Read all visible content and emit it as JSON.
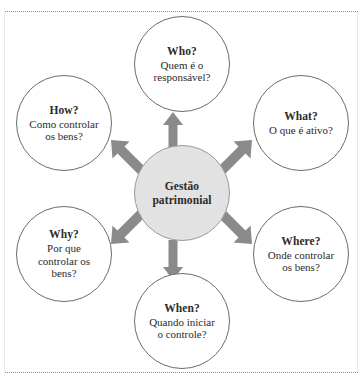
{
  "diagram": {
    "center": {
      "title_line1": "Gestão",
      "title_line2": "patrimonial"
    },
    "nodes": [
      {
        "id": "who",
        "question": "Who?",
        "answer_line1": "Quem é o",
        "answer_line2": "responsável?",
        "answer_line3": "",
        "position": "top"
      },
      {
        "id": "what",
        "question": "What?",
        "answer_line1": "O que é ativo?",
        "answer_line2": "",
        "answer_line3": "",
        "position": "top-right"
      },
      {
        "id": "where",
        "question": "Where?",
        "answer_line1": "Onde controlar",
        "answer_line2": "os bens?",
        "answer_line3": "",
        "position": "bottom-right"
      },
      {
        "id": "when",
        "question": "When?",
        "answer_line1": "Quando iniciar",
        "answer_line2": "o controle?",
        "answer_line3": "",
        "position": "bottom"
      },
      {
        "id": "why",
        "question": "Why?",
        "answer_line1": "Por que",
        "answer_line2": "controlar os",
        "answer_line3": "bens?",
        "position": "bottom-left"
      },
      {
        "id": "how",
        "question": "How?",
        "answer_line1": "Como controlar",
        "answer_line2": "os bens?",
        "answer_line3": "",
        "position": "top-left"
      }
    ],
    "arrows": [
      {
        "id": "up",
        "direction": "up"
      },
      {
        "id": "up-right",
        "direction": "up-right"
      },
      {
        "id": "down-right",
        "direction": "down-right"
      },
      {
        "id": "down",
        "direction": "down"
      },
      {
        "id": "down-left",
        "direction": "down-left"
      },
      {
        "id": "up-left",
        "direction": "up-left"
      }
    ],
    "colors": {
      "center_fill": "#e2e2e2",
      "center_stroke": "#9a9a9a",
      "satellite_fill": "#ffffff",
      "satellite_stroke": "#6b6b6b",
      "arrow_fill": "#8a8a8a",
      "text": "#2b2b2b",
      "rule": "#8d8d8d"
    }
  }
}
